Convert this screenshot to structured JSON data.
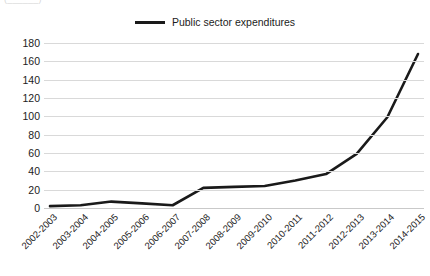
{
  "caption_fragment": "(______)",
  "legend": {
    "position": "top-center",
    "entries": [
      {
        "label": "Public sector expenditures",
        "color": "#1a1a1a",
        "marker": "line-swatch"
      }
    ]
  },
  "axes": {
    "y_ticks": [
      180,
      160,
      140,
      120,
      100,
      80,
      60,
      40,
      20,
      0
    ],
    "x_ticks": [
      "2002-2003",
      "2003-2004",
      "2004-2005",
      "2005-2006",
      "2006-2007",
      "2007-2008",
      "2008-2009",
      "2009-2010",
      "2010-2011",
      "2011-2012",
      "2012-2013",
      "2013-2014",
      "2014-2015"
    ]
  },
  "chart_data": {
    "type": "line",
    "title": "",
    "xlabel": "",
    "ylabel": "",
    "ylim": [
      0,
      180
    ],
    "grid": true,
    "legend_position": "top-center",
    "categories": [
      "2002-2003",
      "2003-2004",
      "2004-2005",
      "2005-2006",
      "2006-2007",
      "2007-2008",
      "2008-2009",
      "2009-2010",
      "2010-2011",
      "2011-2012",
      "2012-2013",
      "2013-2014",
      "2014-2015"
    ],
    "series": [
      {
        "name": "Public sector expenditures",
        "color": "#1a1a1a",
        "values": [
          2,
          3,
          7,
          5,
          3,
          22,
          23,
          24,
          30,
          37,
          59,
          99,
          168
        ]
      }
    ]
  }
}
